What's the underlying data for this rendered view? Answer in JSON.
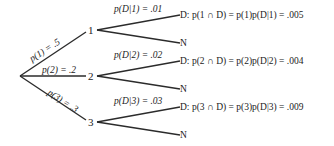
{
  "diagram": {
    "type": "probability-tree",
    "root": {
      "x": 20,
      "y": 76
    },
    "first_level": [
      {
        "node": "1",
        "edge_label": "p(1) = .5",
        "second_level": [
          {
            "outcome": "D",
            "edge_label": "p(D|1) = .01",
            "result": "D: p(1 ∩ D) = p(1)p(D|1) = .005"
          },
          {
            "outcome": "N",
            "result": "N"
          }
        ]
      },
      {
        "node": "2",
        "edge_label": "p(2) = .2",
        "second_level": [
          {
            "outcome": "D",
            "edge_label": "p(D|2) = .02",
            "result": "D: p(2 ∩ D) = p(2)p(D|2) = .004"
          },
          {
            "outcome": "N",
            "result": "N"
          }
        ]
      },
      {
        "node": "3",
        "edge_label": "p(3) = .3",
        "second_level": [
          {
            "outcome": "D",
            "edge_label": "p(D|3) = .03",
            "result": "D: p(3 ∩ D) = p(3)p(D|3) = .009"
          },
          {
            "outcome": "N",
            "result": "N"
          }
        ]
      }
    ]
  },
  "labels": {
    "p1": "p(1) = .5",
    "p2": "p(2) = .2",
    "p3": "p(3) = .3",
    "pd1": "p(D|1) = .01",
    "pd2": "p(D|2) = .02",
    "pd3": "p(D|3) = .03",
    "node1": "1",
    "node2": "2",
    "node3": "3",
    "res1": "D: p(1 ∩ D) = p(1)p(D|1) = .005",
    "res2": "D: p(2 ∩ D) = p(2)p(D|2) = .004",
    "res3": "D: p(3 ∩ D) = p(3)p(D|3) = .009",
    "n1": "N",
    "n2": "N",
    "n3": "N"
  }
}
